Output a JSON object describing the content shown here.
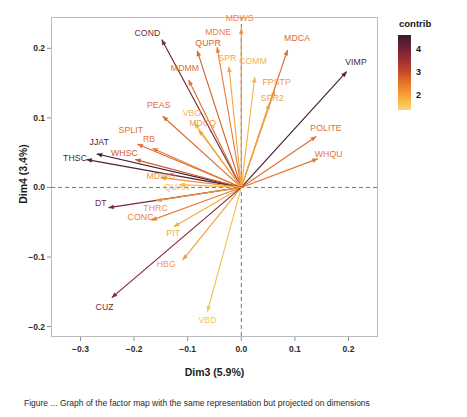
{
  "figure": {
    "caption": "Figure ... Graph of the factor map with the same representation but projected on dimensions"
  },
  "axes": {
    "x_title": "Dim3 (5.9%)",
    "y_title": "Dim4 (3.4%)",
    "x_ticks": [
      "-0.3",
      "-0.2",
      "-0.1",
      "0.0",
      "0.1",
      "0.2"
    ],
    "y_ticks": [
      "0.2",
      "0.1",
      "0.0",
      "-0.1",
      "-0.2"
    ],
    "xlim": [
      -0.355,
      0.255
    ],
    "ylim": [
      -0.215,
      0.245
    ]
  },
  "legend": {
    "title": "contrib",
    "ticks": [
      "4",
      "3",
      "2"
    ],
    "colors": [
      "#3d1a2b",
      "#8c2a33",
      "#e8742a",
      "#fbbd4b"
    ]
  },
  "chart_data": {
    "type": "scatter",
    "title": "",
    "xlabel": "Dim3 (5.9%)",
    "ylabel": "Dim4 (3.4%)",
    "xlim": [
      -0.355,
      0.255
    ],
    "ylim": [
      -0.215,
      0.245
    ],
    "grid": false,
    "legend_position": "right",
    "colorbar": {
      "label": "contrib",
      "ticks": [
        4,
        3,
        2
      ],
      "min": 1.5,
      "max": 4.4
    },
    "note": "PCA variable factor map: each arrow starts at origin (0,0); color encodes contribution",
    "variables": [
      {
        "label": "COND",
        "x": -0.148,
        "y": 0.212,
        "contrib": 3.9,
        "color": "#6d2a3d",
        "lx": -0.175,
        "ly": 0.222
      },
      {
        "label": "QUPR",
        "x": -0.082,
        "y": 0.196,
        "contrib": 2.9,
        "color": "#d4602c",
        "lx": -0.062,
        "ly": 0.208
      },
      {
        "label": "MDNE",
        "x": -0.045,
        "y": 0.201,
        "contrib": 2.5,
        "color": "#e8813a",
        "lx": -0.043,
        "ly": 0.223
      },
      {
        "label": "MDWS",
        "x": 0.0,
        "y": 0.228,
        "contrib": 2.5,
        "color": "#ed8d3c",
        "lx": -0.003,
        "ly": 0.243
      },
      {
        "label": "MDCA",
        "x": 0.086,
        "y": 0.197,
        "contrib": 2.9,
        "color": "#d9692d",
        "lx": 0.104,
        "ly": 0.215
      },
      {
        "label": "VIMP",
        "x": 0.196,
        "y": 0.166,
        "contrib": 4.2,
        "color": "#4a1d33",
        "lx": 0.214,
        "ly": 0.18
      },
      {
        "label": "MDMM",
        "x": -0.098,
        "y": 0.154,
        "contrib": 2.7,
        "color": "#e0702f",
        "lx": -0.105,
        "ly": 0.172
      },
      {
        "label": "SPR",
        "x": -0.023,
        "y": 0.173,
        "contrib": 2.2,
        "color": "#f3a744",
        "lx": -0.026,
        "ly": 0.186
      },
      {
        "label": "COMM",
        "x": 0.025,
        "y": 0.158,
        "contrib": 2.1,
        "color": "#f6b34a",
        "lx": 0.022,
        "ly": 0.182
      },
      {
        "label": "FPSTP",
        "x": 0.062,
        "y": 0.139,
        "contrib": 2.4,
        "color": "#ef9840",
        "lx": 0.066,
        "ly": 0.152
      },
      {
        "label": "SPR2",
        "x": 0.052,
        "y": 0.12,
        "contrib": 2.3,
        "color": "#f2a343",
        "lx": 0.058,
        "ly": 0.128
      },
      {
        "label": "PEAS",
        "x": -0.146,
        "y": 0.102,
        "contrib": 2.8,
        "color": "#dd6b2e",
        "lx": -0.154,
        "ly": 0.118
      },
      {
        "label": "VBG",
        "x": -0.087,
        "y": 0.092,
        "contrib": 2.1,
        "color": "#f6b34a",
        "lx": -0.092,
        "ly": 0.107
      },
      {
        "label": "MDCQ",
        "x": -0.079,
        "y": 0.082,
        "contrib": 2.3,
        "color": "#f0a041",
        "lx": -0.072,
        "ly": 0.093
      },
      {
        "label": "POLITE",
        "x": 0.139,
        "y": 0.073,
        "contrib": 2.8,
        "color": "#e06f2f",
        "lx": 0.158,
        "ly": 0.086
      },
      {
        "label": "SPLIT",
        "x": -0.193,
        "y": 0.062,
        "contrib": 2.8,
        "color": "#de6c2e",
        "lx": -0.206,
        "ly": 0.082
      },
      {
        "label": "RB",
        "x": -0.165,
        "y": 0.056,
        "contrib": 2.6,
        "color": "#e47a34",
        "lx": -0.172,
        "ly": 0.069
      },
      {
        "label": "WHQU",
        "x": 0.142,
        "y": 0.041,
        "contrib": 2.8,
        "color": "#e2732f",
        "lx": 0.163,
        "ly": 0.048
      },
      {
        "label": "JJAT",
        "x": -0.269,
        "y": 0.048,
        "contrib": 4.1,
        "color": "#3f1b30",
        "lx": -0.265,
        "ly": 0.066
      },
      {
        "label": "THSC",
        "x": -0.288,
        "y": 0.04,
        "contrib": 3.9,
        "color": "#54203a",
        "lx": -0.31,
        "ly": 0.042
      },
      {
        "label": "WHSC",
        "x": -0.197,
        "y": 0.04,
        "contrib": 3.0,
        "color": "#cf5a2c",
        "lx": -0.218,
        "ly": 0.05
      },
      {
        "label": "MDWO",
        "x": -0.15,
        "y": 0.014,
        "contrib": 2.4,
        "color": "#ee9340",
        "lx": -0.15,
        "ly": 0.016
      },
      {
        "label": "QUAN",
        "x": -0.115,
        "y": 0.004,
        "contrib": 2.1,
        "color": "#f7ba4d",
        "lx": -0.12,
        "ly": 0.0
      },
      {
        "label": "DT",
        "x": -0.247,
        "y": -0.029,
        "contrib": 3.7,
        "color": "#7d2736",
        "lx": -0.262,
        "ly": -0.022
      },
      {
        "label": "THRC",
        "x": -0.158,
        "y": -0.019,
        "contrib": 2.4,
        "color": "#ee9340",
        "lx": -0.16,
        "ly": -0.03
      },
      {
        "label": "CONC",
        "x": -0.167,
        "y": -0.047,
        "contrib": 2.6,
        "color": "#e78130",
        "lx": -0.188,
        "ly": -0.042
      },
      {
        "label": "PIT",
        "x": -0.125,
        "y": -0.056,
        "contrib": 2.2,
        "color": "#f3a845",
        "lx": -0.127,
        "ly": -0.065
      },
      {
        "label": "HBG",
        "x": -0.109,
        "y": -0.104,
        "contrib": 2.3,
        "color": "#f0a041",
        "lx": -0.14,
        "ly": -0.11
      },
      {
        "label": "CUZ",
        "x": -0.241,
        "y": -0.158,
        "contrib": 3.7,
        "color": "#7e2836",
        "lx": -0.255,
        "ly": -0.172
      },
      {
        "label": "VBD",
        "x": -0.063,
        "y": -0.178,
        "contrib": 2.0,
        "color": "#f9c254",
        "lx": -0.063,
        "ly": -0.19
      }
    ]
  }
}
